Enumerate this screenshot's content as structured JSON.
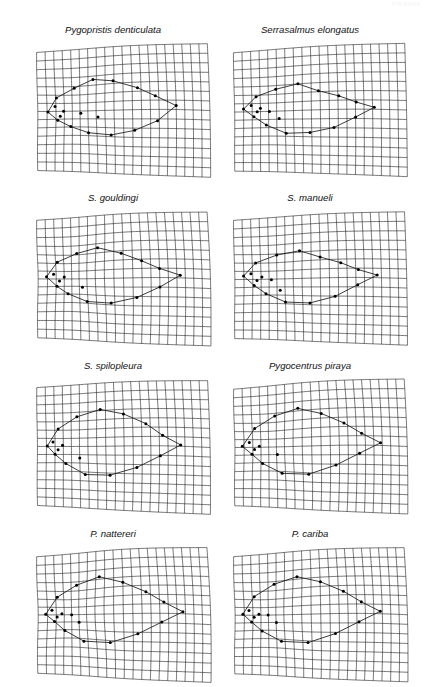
{
  "figure": {
    "type": "thin-plate-spline-deformation-grids",
    "running_head": "PIRANHA",
    "page_number": "",
    "columns": 2,
    "rows": 4,
    "panel_width": 172,
    "panel_height": 126,
    "grid_cols": 20,
    "grid_rows": 14,
    "line_color": "#1a1a1a",
    "landmark_color": "#000000",
    "background_color": "#ffffff"
  },
  "panels": [
    {
      "label": "Pygopristis denticulata",
      "x": 27,
      "y": 24,
      "warp": {
        "ax": 0.16,
        "ay": -0.09,
        "bx": -0.05,
        "by": 0.12,
        "cx": 0.1,
        "cy": 0.07,
        "shearTop": -7,
        "shearBot": 5,
        "bulgeX": 0.08,
        "bulgeY": -0.05,
        "focusX": 0.23,
        "focusY": 0.5,
        "focusAmt": -0.16
      },
      "outline": [
        [
          0.055,
          0.505
        ],
        [
          0.105,
          0.38
        ],
        [
          0.215,
          0.3
        ],
        [
          0.33,
          0.24
        ],
        [
          0.445,
          0.265
        ],
        [
          0.58,
          0.33
        ],
        [
          0.68,
          0.395
        ],
        [
          0.8,
          0.47
        ],
        [
          0.69,
          0.585
        ],
        [
          0.56,
          0.66
        ],
        [
          0.43,
          0.7
        ],
        [
          0.3,
          0.69
        ],
        [
          0.19,
          0.64
        ],
        [
          0.11,
          0.58
        ]
      ],
      "landmarks": [
        [
          0.055,
          0.505
        ],
        [
          0.105,
          0.38
        ],
        [
          0.215,
          0.3
        ],
        [
          0.33,
          0.24
        ],
        [
          0.445,
          0.265
        ],
        [
          0.58,
          0.33
        ],
        [
          0.68,
          0.395
        ],
        [
          0.8,
          0.47
        ],
        [
          0.69,
          0.585
        ],
        [
          0.56,
          0.66
        ],
        [
          0.43,
          0.7
        ],
        [
          0.3,
          0.69
        ],
        [
          0.19,
          0.64
        ],
        [
          0.11,
          0.58
        ],
        [
          0.145,
          0.5
        ],
        [
          0.255,
          0.52
        ],
        [
          0.36,
          0.555
        ],
        [
          0.095,
          0.455
        ],
        [
          0.125,
          0.545
        ]
      ]
    },
    {
      "label": "Serrasalmus elongatus",
      "x": 224,
      "y": 24,
      "warp": {
        "ax": 0.14,
        "ay": -0.12,
        "bx": -0.03,
        "by": 0.1,
        "cx": 0.06,
        "cy": 0.05,
        "shearTop": -8,
        "shearBot": 4,
        "bulgeX": 0.05,
        "bulgeY": -0.03,
        "focusX": 0.2,
        "focusY": 0.52,
        "focusAmt": -0.1
      },
      "outline": [
        [
          0.05,
          0.475
        ],
        [
          0.125,
          0.37
        ],
        [
          0.245,
          0.315
        ],
        [
          0.375,
          0.285
        ],
        [
          0.49,
          0.35
        ],
        [
          0.605,
          0.395
        ],
        [
          0.705,
          0.445
        ],
        [
          0.81,
          0.485
        ],
        [
          0.7,
          0.56
        ],
        [
          0.575,
          0.64
        ],
        [
          0.44,
          0.68
        ],
        [
          0.305,
          0.69
        ],
        [
          0.185,
          0.62
        ],
        [
          0.11,
          0.545
        ]
      ],
      "landmarks": [
        [
          0.05,
          0.475
        ],
        [
          0.125,
          0.37
        ],
        [
          0.245,
          0.315
        ],
        [
          0.375,
          0.285
        ],
        [
          0.49,
          0.35
        ],
        [
          0.605,
          0.395
        ],
        [
          0.705,
          0.445
        ],
        [
          0.81,
          0.485
        ],
        [
          0.7,
          0.56
        ],
        [
          0.575,
          0.64
        ],
        [
          0.44,
          0.68
        ],
        [
          0.305,
          0.69
        ],
        [
          0.185,
          0.62
        ],
        [
          0.11,
          0.545
        ],
        [
          0.15,
          0.47
        ],
        [
          0.265,
          0.565
        ],
        [
          0.095,
          0.445
        ],
        [
          0.13,
          0.5
        ],
        [
          0.205,
          0.5
        ]
      ]
    },
    {
      "label": "S. gouldingi",
      "x": 27,
      "y": 192,
      "warp": {
        "ax": 0.18,
        "ay": -0.07,
        "bx": -0.08,
        "by": 0.14,
        "cx": 0.12,
        "cy": 0.09,
        "shearTop": -6,
        "shearBot": 6,
        "bulgeX": 0.1,
        "bulgeY": -0.07,
        "focusX": 0.21,
        "focusY": 0.49,
        "focusAmt": -0.22
      },
      "outline": [
        [
          0.045,
          0.48
        ],
        [
          0.11,
          0.345
        ],
        [
          0.235,
          0.275
        ],
        [
          0.36,
          0.245
        ],
        [
          0.49,
          0.305
        ],
        [
          0.6,
          0.37
        ],
        [
          0.7,
          0.43
        ],
        [
          0.82,
          0.48
        ],
        [
          0.7,
          0.57
        ],
        [
          0.57,
          0.65
        ],
        [
          0.43,
          0.7
        ],
        [
          0.295,
          0.7
        ],
        [
          0.175,
          0.64
        ],
        [
          0.105,
          0.57
        ]
      ],
      "landmarks": [
        [
          0.045,
          0.48
        ],
        [
          0.11,
          0.345
        ],
        [
          0.235,
          0.275
        ],
        [
          0.36,
          0.245
        ],
        [
          0.49,
          0.305
        ],
        [
          0.6,
          0.37
        ],
        [
          0.7,
          0.43
        ],
        [
          0.82,
          0.48
        ],
        [
          0.7,
          0.57
        ],
        [
          0.57,
          0.65
        ],
        [
          0.43,
          0.7
        ],
        [
          0.295,
          0.7
        ],
        [
          0.175,
          0.64
        ],
        [
          0.105,
          0.57
        ],
        [
          0.15,
          0.48
        ],
        [
          0.27,
          0.58
        ],
        [
          0.085,
          0.455
        ],
        [
          0.12,
          0.52
        ]
      ]
    },
    {
      "label": "S. manueli",
      "x": 224,
      "y": 192,
      "warp": {
        "ax": 0.15,
        "ay": -0.1,
        "bx": -0.04,
        "by": 0.11,
        "cx": 0.08,
        "cy": 0.06,
        "shearTop": -7,
        "shearBot": 5,
        "bulgeX": 0.07,
        "bulgeY": -0.04,
        "focusX": 0.22,
        "focusY": 0.51,
        "focusAmt": -0.14
      },
      "outline": [
        [
          0.048,
          0.47
        ],
        [
          0.12,
          0.355
        ],
        [
          0.25,
          0.295
        ],
        [
          0.385,
          0.275
        ],
        [
          0.5,
          0.335
        ],
        [
          0.615,
          0.385
        ],
        [
          0.715,
          0.44
        ],
        [
          0.825,
          0.48
        ],
        [
          0.71,
          0.555
        ],
        [
          0.58,
          0.645
        ],
        [
          0.44,
          0.7
        ],
        [
          0.3,
          0.7
        ],
        [
          0.18,
          0.63
        ],
        [
          0.108,
          0.555
        ]
      ],
      "landmarks": [
        [
          0.048,
          0.47
        ],
        [
          0.12,
          0.355
        ],
        [
          0.25,
          0.295
        ],
        [
          0.385,
          0.275
        ],
        [
          0.5,
          0.335
        ],
        [
          0.615,
          0.385
        ],
        [
          0.715,
          0.44
        ],
        [
          0.825,
          0.48
        ],
        [
          0.71,
          0.555
        ],
        [
          0.58,
          0.645
        ],
        [
          0.44,
          0.7
        ],
        [
          0.3,
          0.7
        ],
        [
          0.18,
          0.63
        ],
        [
          0.108,
          0.555
        ],
        [
          0.155,
          0.48
        ],
        [
          0.27,
          0.6
        ],
        [
          0.09,
          0.45
        ],
        [
          0.125,
          0.51
        ],
        [
          0.215,
          0.505
        ]
      ]
    },
    {
      "label": "S. spilopleura",
      "x": 27,
      "y": 360,
      "warp": {
        "ax": 0.13,
        "ay": -0.08,
        "bx": -0.06,
        "by": 0.13,
        "cx": 0.09,
        "cy": 0.08,
        "shearTop": -5,
        "shearBot": 7,
        "bulgeX": 0.09,
        "bulgeY": -0.06,
        "focusX": 0.19,
        "focusY": 0.48,
        "focusAmt": -0.12
      },
      "outline": [
        [
          0.055,
          0.495
        ],
        [
          0.12,
          0.345
        ],
        [
          0.235,
          0.25
        ],
        [
          0.37,
          0.205
        ],
        [
          0.5,
          0.25
        ],
        [
          0.625,
          0.33
        ],
        [
          0.72,
          0.42
        ],
        [
          0.825,
          0.49
        ],
        [
          0.705,
          0.575
        ],
        [
          0.57,
          0.665
        ],
        [
          0.42,
          0.73
        ],
        [
          0.28,
          0.735
        ],
        [
          0.165,
          0.65
        ],
        [
          0.1,
          0.57
        ]
      ],
      "landmarks": [
        [
          0.055,
          0.495
        ],
        [
          0.12,
          0.345
        ],
        [
          0.235,
          0.25
        ],
        [
          0.37,
          0.205
        ],
        [
          0.5,
          0.25
        ],
        [
          0.625,
          0.33
        ],
        [
          0.72,
          0.42
        ],
        [
          0.825,
          0.49
        ],
        [
          0.705,
          0.575
        ],
        [
          0.57,
          0.665
        ],
        [
          0.42,
          0.73
        ],
        [
          0.28,
          0.735
        ],
        [
          0.165,
          0.65
        ],
        [
          0.1,
          0.57
        ],
        [
          0.145,
          0.49
        ],
        [
          0.25,
          0.6
        ],
        [
          0.088,
          0.46
        ],
        [
          0.118,
          0.53
        ]
      ]
    },
    {
      "label": "Pygocentrus piraya",
      "x": 224,
      "y": 360,
      "warp": {
        "ax": 0.17,
        "ay": -0.11,
        "bx": -0.07,
        "by": 0.15,
        "cx": 0.11,
        "cy": 0.08,
        "shearTop": -8,
        "shearBot": 6,
        "bulgeX": 0.11,
        "bulgeY": -0.07,
        "focusX": 0.2,
        "focusY": 0.5,
        "focusAmt": -0.18
      },
      "outline": [
        [
          0.04,
          0.49
        ],
        [
          0.115,
          0.33
        ],
        [
          0.24,
          0.235
        ],
        [
          0.375,
          0.195
        ],
        [
          0.505,
          0.25
        ],
        [
          0.63,
          0.33
        ],
        [
          0.73,
          0.41
        ],
        [
          0.84,
          0.48
        ],
        [
          0.715,
          0.56
        ],
        [
          0.58,
          0.65
        ],
        [
          0.43,
          0.725
        ],
        [
          0.28,
          0.73
        ],
        [
          0.16,
          0.65
        ],
        [
          0.095,
          0.565
        ]
      ],
      "landmarks": [
        [
          0.04,
          0.49
        ],
        [
          0.115,
          0.33
        ],
        [
          0.24,
          0.235
        ],
        [
          0.375,
          0.195
        ],
        [
          0.505,
          0.25
        ],
        [
          0.63,
          0.33
        ],
        [
          0.73,
          0.41
        ],
        [
          0.84,
          0.48
        ],
        [
          0.715,
          0.56
        ],
        [
          0.58,
          0.65
        ],
        [
          0.43,
          0.725
        ],
        [
          0.28,
          0.73
        ],
        [
          0.16,
          0.65
        ],
        [
          0.095,
          0.565
        ],
        [
          0.14,
          0.49
        ],
        [
          0.255,
          0.57
        ],
        [
          0.08,
          0.455
        ],
        [
          0.11,
          0.52
        ]
      ]
    },
    {
      "label": "P. nattereri",
      "x": 27,
      "y": 528,
      "warp": {
        "ax": 0.19,
        "ay": -0.1,
        "bx": -0.09,
        "by": 0.14,
        "cx": 0.13,
        "cy": 0.09,
        "shearTop": -7,
        "shearBot": 7,
        "bulgeX": 0.1,
        "bulgeY": -0.08,
        "focusX": 0.21,
        "focusY": 0.49,
        "focusAmt": -0.24
      },
      "outline": [
        [
          0.04,
          0.495
        ],
        [
          0.11,
          0.335
        ],
        [
          0.235,
          0.24
        ],
        [
          0.37,
          0.195
        ],
        [
          0.5,
          0.255
        ],
        [
          0.625,
          0.335
        ],
        [
          0.725,
          0.415
        ],
        [
          0.835,
          0.485
        ],
        [
          0.71,
          0.565
        ],
        [
          0.575,
          0.655
        ],
        [
          0.425,
          0.73
        ],
        [
          0.275,
          0.735
        ],
        [
          0.155,
          0.65
        ],
        [
          0.09,
          0.565
        ]
      ],
      "landmarks": [
        [
          0.04,
          0.495
        ],
        [
          0.11,
          0.335
        ],
        [
          0.235,
          0.24
        ],
        [
          0.37,
          0.195
        ],
        [
          0.5,
          0.255
        ],
        [
          0.625,
          0.335
        ],
        [
          0.725,
          0.415
        ],
        [
          0.835,
          0.485
        ],
        [
          0.71,
          0.565
        ],
        [
          0.575,
          0.655
        ],
        [
          0.425,
          0.73
        ],
        [
          0.275,
          0.735
        ],
        [
          0.155,
          0.65
        ],
        [
          0.09,
          0.565
        ],
        [
          0.135,
          0.49
        ],
        [
          0.25,
          0.575
        ],
        [
          0.075,
          0.455
        ],
        [
          0.105,
          0.52
        ],
        [
          0.2,
          0.5
        ]
      ]
    },
    {
      "label": "P. cariba",
      "x": 224,
      "y": 528,
      "warp": {
        "ax": 0.18,
        "ay": -0.09,
        "bx": -0.08,
        "by": 0.13,
        "cx": 0.12,
        "cy": 0.08,
        "shearTop": -7,
        "shearBot": 6,
        "bulgeX": 0.1,
        "bulgeY": -0.07,
        "focusX": 0.2,
        "focusY": 0.5,
        "focusAmt": -0.21
      },
      "outline": [
        [
          0.042,
          0.49
        ],
        [
          0.112,
          0.33
        ],
        [
          0.238,
          0.235
        ],
        [
          0.372,
          0.195
        ],
        [
          0.502,
          0.25
        ],
        [
          0.628,
          0.33
        ],
        [
          0.728,
          0.412
        ],
        [
          0.838,
          0.482
        ],
        [
          0.712,
          0.562
        ],
        [
          0.578,
          0.652
        ],
        [
          0.428,
          0.728
        ],
        [
          0.278,
          0.732
        ],
        [
          0.158,
          0.65
        ],
        [
          0.092,
          0.565
        ]
      ],
      "landmarks": [
        [
          0.042,
          0.49
        ],
        [
          0.112,
          0.33
        ],
        [
          0.238,
          0.235
        ],
        [
          0.372,
          0.195
        ],
        [
          0.502,
          0.25
        ],
        [
          0.628,
          0.33
        ],
        [
          0.728,
          0.412
        ],
        [
          0.838,
          0.482
        ],
        [
          0.712,
          0.562
        ],
        [
          0.578,
          0.652
        ],
        [
          0.428,
          0.728
        ],
        [
          0.278,
          0.732
        ],
        [
          0.158,
          0.65
        ],
        [
          0.092,
          0.565
        ],
        [
          0.137,
          0.49
        ],
        [
          0.252,
          0.572
        ],
        [
          0.077,
          0.455
        ],
        [
          0.107,
          0.52
        ],
        [
          0.198,
          0.498
        ]
      ]
    }
  ]
}
